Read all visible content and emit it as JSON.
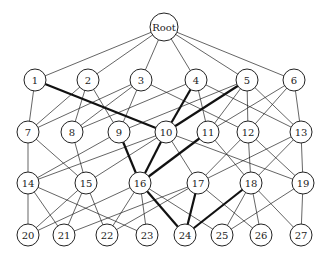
{
  "diagram": {
    "type": "layered-graph",
    "nodes": [
      {
        "id": "Root",
        "label": "Root",
        "x": 164,
        "y": 27,
        "r": 14
      },
      {
        "id": "1",
        "label": "1",
        "x": 35,
        "y": 80,
        "r": 11
      },
      {
        "id": "2",
        "label": "2",
        "x": 88,
        "y": 80,
        "r": 11
      },
      {
        "id": "3",
        "label": "3",
        "x": 141,
        "y": 80,
        "r": 11
      },
      {
        "id": "4",
        "label": "4",
        "x": 196,
        "y": 80,
        "r": 11
      },
      {
        "id": "5",
        "label": "5",
        "x": 247,
        "y": 80,
        "r": 11
      },
      {
        "id": "6",
        "label": "6",
        "x": 294,
        "y": 80,
        "r": 11
      },
      {
        "id": "7",
        "label": "7",
        "x": 28,
        "y": 132,
        "r": 11
      },
      {
        "id": "8",
        "label": "8",
        "x": 72,
        "y": 132,
        "r": 11
      },
      {
        "id": "9",
        "label": "9",
        "x": 119,
        "y": 132,
        "r": 11
      },
      {
        "id": "10",
        "label": "10",
        "x": 166,
        "y": 132,
        "r": 11
      },
      {
        "id": "11",
        "label": "11",
        "x": 208,
        "y": 132,
        "r": 11
      },
      {
        "id": "12",
        "label": "12",
        "x": 248,
        "y": 132,
        "r": 11
      },
      {
        "id": "13",
        "label": "13",
        "x": 301,
        "y": 132,
        "r": 11
      },
      {
        "id": "14",
        "label": "14",
        "x": 28,
        "y": 183,
        "r": 11
      },
      {
        "id": "15",
        "label": "15",
        "x": 86,
        "y": 183,
        "r": 11
      },
      {
        "id": "16",
        "label": "16",
        "x": 140,
        "y": 183,
        "r": 11
      },
      {
        "id": "17",
        "label": "17",
        "x": 198,
        "y": 183,
        "r": 11
      },
      {
        "id": "18",
        "label": "18",
        "x": 251,
        "y": 183,
        "r": 11
      },
      {
        "id": "19",
        "label": "19",
        "x": 303,
        "y": 183,
        "r": 11
      },
      {
        "id": "20",
        "label": "20",
        "x": 28,
        "y": 235,
        "r": 11
      },
      {
        "id": "21",
        "label": "21",
        "x": 64,
        "y": 235,
        "r": 11
      },
      {
        "id": "22",
        "label": "22",
        "x": 107,
        "y": 235,
        "r": 11
      },
      {
        "id": "23",
        "label": "23",
        "x": 147,
        "y": 235,
        "r": 11
      },
      {
        "id": "24",
        "label": "24",
        "x": 185,
        "y": 235,
        "r": 11
      },
      {
        "id": "25",
        "label": "25",
        "x": 222,
        "y": 235,
        "r": 11
      },
      {
        "id": "26",
        "label": "26",
        "x": 261,
        "y": 235,
        "r": 11
      },
      {
        "id": "27",
        "label": "27",
        "x": 301,
        "y": 235,
        "r": 11
      }
    ],
    "edges": [
      {
        "from": "Root",
        "to": "1"
      },
      {
        "from": "Root",
        "to": "2"
      },
      {
        "from": "Root",
        "to": "3"
      },
      {
        "from": "Root",
        "to": "4"
      },
      {
        "from": "Root",
        "to": "5"
      },
      {
        "from": "Root",
        "to": "6"
      },
      {
        "from": "1",
        "to": "7"
      },
      {
        "from": "1",
        "to": "10",
        "bold": true
      },
      {
        "from": "2",
        "to": "7"
      },
      {
        "from": "2",
        "to": "8"
      },
      {
        "from": "2",
        "to": "9"
      },
      {
        "from": "3",
        "to": "7"
      },
      {
        "from": "3",
        "to": "8"
      },
      {
        "from": "3",
        "to": "9"
      },
      {
        "from": "3",
        "to": "12"
      },
      {
        "from": "4",
        "to": "8"
      },
      {
        "from": "4",
        "to": "10",
        "bold": true
      },
      {
        "from": "4",
        "to": "11"
      },
      {
        "from": "4",
        "to": "13"
      },
      {
        "from": "5",
        "to": "9"
      },
      {
        "from": "5",
        "to": "10",
        "bold": true
      },
      {
        "from": "5",
        "to": "11"
      },
      {
        "from": "5",
        "to": "12"
      },
      {
        "from": "5",
        "to": "13"
      },
      {
        "from": "6",
        "to": "11"
      },
      {
        "from": "6",
        "to": "12"
      },
      {
        "from": "6",
        "to": "13"
      },
      {
        "from": "7",
        "to": "14"
      },
      {
        "from": "7",
        "to": "15"
      },
      {
        "from": "8",
        "to": "15"
      },
      {
        "from": "9",
        "to": "14"
      },
      {
        "from": "9",
        "to": "16",
        "bold": true
      },
      {
        "from": "10",
        "to": "14"
      },
      {
        "from": "10",
        "to": "15"
      },
      {
        "from": "10",
        "to": "16",
        "bold": true
      },
      {
        "from": "10",
        "to": "17"
      },
      {
        "from": "10",
        "to": "19"
      },
      {
        "from": "11",
        "to": "16",
        "bold": true
      },
      {
        "from": "11",
        "to": "18"
      },
      {
        "from": "12",
        "to": "17"
      },
      {
        "from": "12",
        "to": "18"
      },
      {
        "from": "12",
        "to": "19"
      },
      {
        "from": "13",
        "to": "17"
      },
      {
        "from": "13",
        "to": "18"
      },
      {
        "from": "13",
        "to": "19"
      },
      {
        "from": "14",
        "to": "20"
      },
      {
        "from": "14",
        "to": "21"
      },
      {
        "from": "14",
        "to": "23"
      },
      {
        "from": "15",
        "to": "20"
      },
      {
        "from": "15",
        "to": "21"
      },
      {
        "from": "15",
        "to": "22"
      },
      {
        "from": "16",
        "to": "20"
      },
      {
        "from": "16",
        "to": "22"
      },
      {
        "from": "16",
        "to": "23"
      },
      {
        "from": "16",
        "to": "24",
        "bold": true
      },
      {
        "from": "16",
        "to": "25"
      },
      {
        "from": "17",
        "to": "21"
      },
      {
        "from": "17",
        "to": "22"
      },
      {
        "from": "17",
        "to": "24",
        "bold": true
      },
      {
        "from": "17",
        "to": "26"
      },
      {
        "from": "18",
        "to": "24",
        "bold": true
      },
      {
        "from": "18",
        "to": "25"
      },
      {
        "from": "18",
        "to": "26"
      },
      {
        "from": "18",
        "to": "27"
      },
      {
        "from": "19",
        "to": "25"
      },
      {
        "from": "19",
        "to": "27"
      }
    ]
  }
}
